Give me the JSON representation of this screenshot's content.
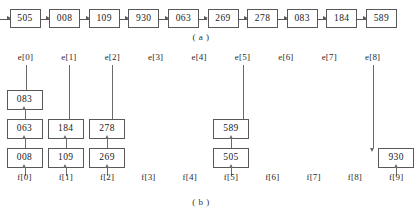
{
  "figure": {
    "caption_a": "( a )",
    "caption_b": "( b )"
  },
  "part_a": {
    "label": "unsorted input list",
    "cells": [
      "505",
      "008",
      "109",
      "930",
      "063",
      "269",
      "278",
      "083",
      "184",
      "589"
    ],
    "connector_count": 10
  },
  "part_b": {
    "e_labels": [
      "e[0]",
      "e[1]",
      "e[2]",
      "e[3]",
      "e[4]",
      "e[5]",
      "e[6]",
      "e[7]",
      "e[8]"
    ],
    "f_labels": [
      "f[0]",
      "f[1]",
      "f[2]",
      "f[3]",
      "f[4]",
      "f[5]",
      "f[6]",
      "f[7]",
      "f[8]",
      "f[9]"
    ],
    "buckets": [
      {
        "index": 0,
        "f_label": "f[0]",
        "items": [
          "083",
          "063",
          "008"
        ]
      },
      {
        "index": 1,
        "f_label": "f[1]",
        "items": [
          "184",
          "109"
        ]
      },
      {
        "index": 2,
        "f_label": "f[2]",
        "items": [
          "278",
          "269"
        ]
      },
      {
        "index": 3,
        "f_label": "f[3]",
        "items": []
      },
      {
        "index": 4,
        "f_label": "f[4]",
        "items": []
      },
      {
        "index": 5,
        "f_label": "f[5]",
        "items": [
          "589",
          "505"
        ]
      },
      {
        "index": 6,
        "f_label": "f[6]",
        "items": []
      },
      {
        "index": 7,
        "f_label": "f[7]",
        "items": []
      },
      {
        "index": 8,
        "f_label": "f[8]",
        "items": []
      },
      {
        "index": 9,
        "f_label": "f[9]",
        "items": [
          "930"
        ]
      }
    ]
  },
  "colors": {
    "box_border": "#585858",
    "arrow": "#6a6a6a",
    "text": "#1a1a1a",
    "background": "#ffffff"
  }
}
